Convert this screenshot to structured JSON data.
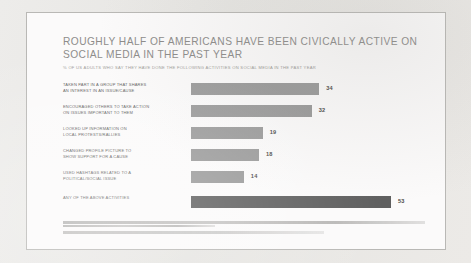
{
  "chart_data": {
    "type": "bar",
    "orientation": "horizontal",
    "title": "ROUGHLY HALF OF AMERICANS HAVE BEEN CIVICALLY ACTIVE ON SOCIAL MEDIA IN THE PAST YEAR",
    "title_line1": "ROUGHLY HALF OF AMERICANS HAVE BEEN CIVICALLY ACTIVE ON",
    "title_line2": "SOCIAL MEDIA IN THE PAST YEAR",
    "subtitle": "% OF US ADULTS WHO SAY THEY HAVE DONE THE FOLLOWING ACTIVITIES ON SOCIAL MEDIA IN THE PAST YEAR",
    "xlabel": "",
    "ylabel": "",
    "xlim": [
      0,
      53
    ],
    "grid": false,
    "legend": false,
    "bar_color": "#9a9a9a",
    "highlight_color": "#5f5f5f",
    "categories": [
      "TAKEN PART IN A GROUP THAT SHARES AN INTEREST IN AN ISSUE/CAUSE",
      "ENCOURAGED OTHERS TO TAKE ACTION ON ISSUES IMPORTANT TO THEM",
      "LOOKED UP INFORMATION ON LOCAL PROTESTS/RALLIES",
      "CHANGED PROFILE PICTURE TO SHOW SUPPORT FOR A CAUSE",
      "USED HASHTAGS RELATED TO A POLITICAL/SOCIAL ISSUE",
      "ANY OF THE ABOVE ACTIVITIES"
    ],
    "values": [
      34,
      32,
      19,
      18,
      14,
      53
    ],
    "bars": [
      {
        "label_line1": "TAKEN PART IN A GROUP THAT SHARES",
        "label_line2": "AN INTEREST IN AN ISSUE/CAUSE",
        "value": 34,
        "value_label": "34",
        "highlight": false
      },
      {
        "label_line1": "ENCOURAGED OTHERS TO TAKE ACTION",
        "label_line2": "ON ISSUES IMPORTANT TO THEM",
        "value": 32,
        "value_label": "32",
        "highlight": false
      },
      {
        "label_line1": "LOOKED UP INFORMATION ON",
        "label_line2": "LOCAL PROTESTS/RALLIES",
        "value": 19,
        "value_label": "19",
        "highlight": false
      },
      {
        "label_line1": "CHANGED PROFILE PICTURE TO",
        "label_line2": "SHOW SUPPORT FOR A CAUSE",
        "value": 18,
        "value_label": "18",
        "highlight": false
      },
      {
        "label_line1": "USED HASHTAGS RELATED TO A",
        "label_line2": "POLITICAL/SOCIAL ISSUE",
        "value": 14,
        "value_label": "14",
        "highlight": false
      },
      {
        "label_line1": "ANY OF THE ABOVE ACTIVITIES",
        "label_line2": "",
        "value": 53,
        "value_label": "53",
        "highlight": true
      }
    ]
  }
}
